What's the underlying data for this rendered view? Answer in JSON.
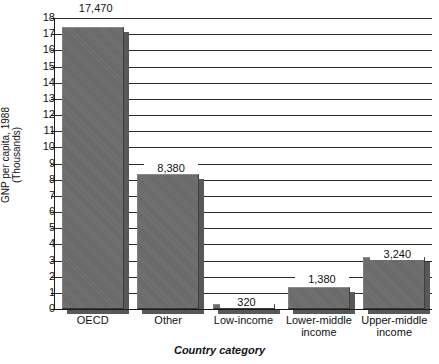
{
  "chart_data": {
    "type": "bar",
    "title": "",
    "xlabel": "Country category",
    "ylabel": "GNP per capita, 1988 (Thousands)",
    "ylabel_line1": "GNP per capita, 1988",
    "ylabel_line2": "(Thousands)",
    "categories": [
      "OECD",
      "Other",
      "Low-income",
      "Lower-middle income",
      "Upper-middle income"
    ],
    "category_labels": [
      "OECD",
      "Other",
      "Low-income",
      "Lower-middle\nincome",
      "Upper-middle\nincome"
    ],
    "values": [
      17470,
      8380,
      320,
      1380,
      3240
    ],
    "value_labels": [
      "17,470",
      "8,380",
      "320",
      "1,380",
      "3,240"
    ],
    "values_thousands": [
      17.47,
      8.38,
      0.32,
      1.38,
      3.24
    ],
    "ylim": [
      0,
      18
    ],
    "ytick_labels": [
      "18",
      "17",
      "16",
      "15",
      "14",
      "13",
      "12",
      "11",
      "10",
      "9",
      "8",
      "7",
      "6",
      "5",
      "4",
      "3",
      "2",
      "1",
      "0"
    ],
    "ytick_values": [
      18,
      17,
      16,
      15,
      14,
      13,
      12,
      11,
      10,
      9,
      8,
      7,
      6,
      5,
      4,
      3,
      2,
      1,
      0
    ],
    "grid": true,
    "grid_axis": "y",
    "legend": false,
    "bar_color": "#6c6c6c",
    "bar_shadow_color": "#585858",
    "axis_color": "#1a1a1a",
    "grid_color": "#2b2b2b",
    "background_color": "#ffffff",
    "units": "GNP per capita in US dollars, 1988"
  }
}
